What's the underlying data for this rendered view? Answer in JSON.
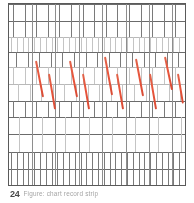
{
  "document": {
    "kind": "scanned-recording-chart",
    "background_color": "#ffffff"
  },
  "chart_frame": {
    "border_color": "#5a5a5a",
    "x": 8,
    "y": 3,
    "width": 178,
    "height": 183
  },
  "caption": {
    "number": "24",
    "text": "Figure: chart record strip"
  },
  "chart_data": {
    "type": "line",
    "title": "",
    "subtitle": "",
    "xlabel": "",
    "ylabel": "",
    "grid": true,
    "legend_position": "none",
    "xlim": [
      0,
      178
    ],
    "ylim": [
      0,
      183
    ],
    "accent_color": "#e8553c",
    "gridline_color": "#6b6b6b",
    "tick_color": "#9a9a9a",
    "band_separators_y": [
      0,
      17,
      33,
      48,
      63,
      80,
      97,
      113,
      130,
      148,
      165,
      182
    ],
    "major_verticals_x": [
      23,
      46,
      70,
      93,
      117,
      140,
      163
    ],
    "event_series": {
      "name": "event-slashes",
      "count": 10,
      "color": "#e8553c",
      "points": [
        {
          "x": 26,
          "y": 57,
          "dx": 7,
          "dy": 36,
          "band": "upper"
        },
        {
          "x": 39,
          "y": 70,
          "dx": 6,
          "dy": 35,
          "band": "lower"
        },
        {
          "x": 60,
          "y": 57,
          "dx": 7,
          "dy": 36,
          "band": "upper"
        },
        {
          "x": 73,
          "y": 70,
          "dx": 6,
          "dy": 35,
          "band": "lower"
        },
        {
          "x": 95,
          "y": 53,
          "dx": 7,
          "dy": 38,
          "band": "upper"
        },
        {
          "x": 107,
          "y": 70,
          "dx": 6,
          "dy": 35,
          "band": "lower"
        },
        {
          "x": 126,
          "y": 55,
          "dx": 7,
          "dy": 37,
          "band": "upper"
        },
        {
          "x": 140,
          "y": 70,
          "dx": 6,
          "dy": 35,
          "band": "lower"
        },
        {
          "x": 155,
          "y": 53,
          "dx": 7,
          "dy": 33,
          "band": "upper"
        },
        {
          "x": 168,
          "y": 70,
          "dx": 5,
          "dy": 30,
          "band": "lower"
        }
      ]
    },
    "tick_bands": [
      {
        "band": 0,
        "y0": 1,
        "y1": 17,
        "spacing": 11.6,
        "offset": 4,
        "weight": "dark"
      },
      {
        "band": 1,
        "y0": 17,
        "y1": 33,
        "spacing": 11.6,
        "offset": 4,
        "weight": "dark"
      },
      {
        "band": 2,
        "y0": 33,
        "y1": 48,
        "spacing": 5.8,
        "offset": 2,
        "weight": "light"
      },
      {
        "band": 3,
        "y0": 48,
        "y1": 63,
        "spacing": 11.6,
        "offset": 7,
        "weight": "dark"
      },
      {
        "band": 4,
        "y0": 63,
        "y1": 80,
        "spacing": 11.6,
        "offset": 4,
        "weight": "light"
      },
      {
        "band": 5,
        "y0": 80,
        "y1": 97,
        "spacing": 11.6,
        "offset": 9,
        "weight": "light"
      },
      {
        "band": 6,
        "y0": 97,
        "y1": 113,
        "spacing": 11.6,
        "offset": 4,
        "weight": "dark"
      },
      {
        "band": 7,
        "y0": 113,
        "y1": 130,
        "spacing": 23.2,
        "offset": 10,
        "weight": "light"
      },
      {
        "band": 8,
        "y0": 130,
        "y1": 148,
        "spacing": 23.2,
        "offset": 10,
        "weight": "light"
      },
      {
        "band": 9,
        "y0": 148,
        "y1": 165,
        "spacing": 5.8,
        "offset": 2,
        "weight": "dark"
      },
      {
        "band": 10,
        "y0": 165,
        "y1": 182,
        "spacing": 5.8,
        "offset": 2,
        "weight": "dark"
      }
    ]
  }
}
